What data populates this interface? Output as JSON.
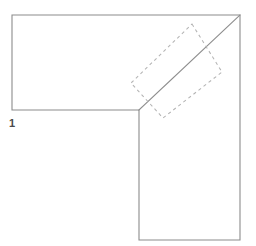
{
  "figure": {
    "canvas": {
      "width": 256,
      "height": 246,
      "background_color": "#ffffff"
    },
    "label": {
      "text": "1",
      "x": 9,
      "y": 118,
      "color": "#4a4a4a"
    },
    "shapes": {
      "l_polygon": {
        "name": "L-shaped outline",
        "stroke_color": "#8c8c8c",
        "points": "12,15 240,15 240,240 139,240 139,110 12,110"
      },
      "fold_line": {
        "name": "Diagonal fold line",
        "stroke_color": "#8c8c8c",
        "x1": 139,
        "y1": 110,
        "x2": 240,
        "y2": 15
      },
      "ghost_rect": {
        "name": "Dashed rotated rectangle",
        "stroke_color": "#b4b4b4",
        "dash_pattern": "3.2 3.2",
        "points": "192,24 222,72 163,118 131,83"
      }
    }
  }
}
